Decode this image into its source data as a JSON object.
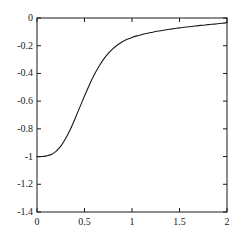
{
  "chart_data": {
    "type": "line",
    "title": "",
    "subtitle": "",
    "xlabel": "",
    "ylabel": "",
    "xlim": [
      0,
      2
    ],
    "ylim": [
      -1.4,
      0
    ],
    "grid": false,
    "legend": null,
    "legend_position": "none",
    "background_color": "#ffffff",
    "line_color": "#1a1a1a",
    "line_width": 1.1,
    "axis_color": "#1a1a1a",
    "box_frame": true,
    "tick_direction": "in",
    "x_ticks": [
      0,
      0.5,
      1,
      1.5,
      2
    ],
    "x_tick_labels": [
      "0",
      "0.5",
      "1",
      "1.5",
      "2"
    ],
    "y_ticks": [
      0,
      -0.2,
      -0.4,
      -0.6,
      -0.8,
      -1,
      -1.2,
      -1.4
    ],
    "y_tick_labels": [
      "0",
      "-0.2",
      "-0.4",
      "-0.6",
      "-0.8",
      "-1",
      "-1.2",
      "-1.4"
    ],
    "series": [
      {
        "name": "curve",
        "x": [
          0,
          0.05,
          0.1,
          0.15,
          0.2,
          0.25,
          0.3,
          0.35,
          0.4,
          0.45,
          0.5,
          0.55,
          0.6,
          0.65,
          0.7,
          0.75,
          0.8,
          0.85,
          0.9,
          0.95,
          1.0,
          1.05,
          1.1,
          1.15,
          1.2,
          1.25,
          1.3,
          1.35,
          1.4,
          1.45,
          1.5,
          1.55,
          1.6,
          1.65,
          1.7,
          1.75,
          1.8,
          1.85,
          1.9,
          1.95,
          2.0
        ],
        "y": [
          -1.0,
          -1.0,
          -0.995,
          -0.985,
          -0.962,
          -0.925,
          -0.872,
          -0.805,
          -0.727,
          -0.645,
          -0.563,
          -0.485,
          -0.414,
          -0.352,
          -0.299,
          -0.256,
          -0.221,
          -0.193,
          -0.171,
          -0.154,
          -0.14,
          -0.129,
          -0.12,
          -0.112,
          -0.105,
          -0.098,
          -0.092,
          -0.086,
          -0.081,
          -0.076,
          -0.071,
          -0.067,
          -0.063,
          -0.059,
          -0.055,
          -0.052,
          -0.048,
          -0.045,
          -0.042,
          -0.038,
          -0.033
        ]
      }
    ],
    "key_points": [
      {
        "x": 0,
        "y": -1.0
      },
      {
        "x": 0.25,
        "y": -0.925
      },
      {
        "x": 0.5,
        "y": -0.563
      },
      {
        "x": 0.75,
        "y": -0.256
      },
      {
        "x": 1.0,
        "y": -0.14
      },
      {
        "x": 1.5,
        "y": -0.071
      },
      {
        "x": 2.0,
        "y": -0.033
      }
    ]
  },
  "axes_geometry": {
    "left_px": 37,
    "right_px": 227,
    "top_px": 18,
    "bottom_px": 212
  }
}
